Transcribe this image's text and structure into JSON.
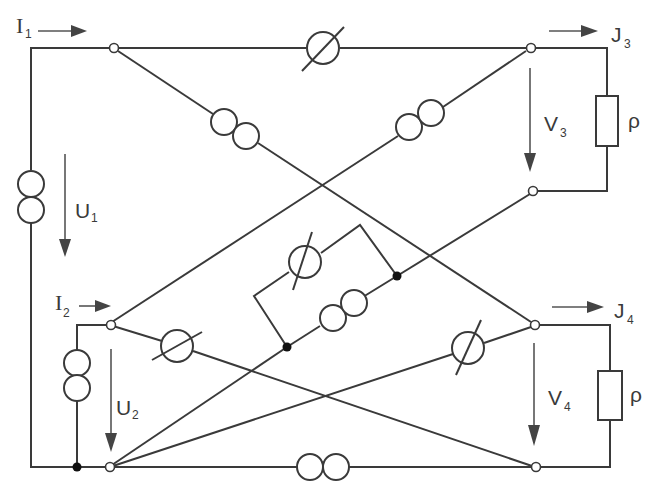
{
  "diagram": {
    "type": "circuit-schematic",
    "colors": {
      "line": "#3a3a3a",
      "background": "#ffffff",
      "label": "#3a3a3a"
    },
    "labels": {
      "I1": {
        "main": "I",
        "sub": "1"
      },
      "I2": {
        "main": "I",
        "sub": "2"
      },
      "U1": {
        "main": "U",
        "sub": "1"
      },
      "U2": {
        "main": "U",
        "sub": "2"
      },
      "J3": {
        "main": "J",
        "sub": "3"
      },
      "J4": {
        "main": "J",
        "sub": "4"
      },
      "V3": {
        "main": "V",
        "sub": "3"
      },
      "V4": {
        "main": "V",
        "sub": "4"
      },
      "rho_top": "ρ",
      "rho_bottom": "ρ"
    },
    "components": [
      {
        "id": "source-left-outer",
        "kind": "current-source (double circle)",
        "position": "left vertical branch"
      },
      {
        "id": "source-left-inner",
        "kind": "current-source (double circle)",
        "position": "port 2 vertical branch"
      },
      {
        "id": "source-diag-1",
        "kind": "current-source (double circle)",
        "position": "top-left to bottom-right diagonal"
      },
      {
        "id": "source-diag-2",
        "kind": "current-source (double circle)",
        "position": "bottom-left to top-right diagonal"
      },
      {
        "id": "source-center",
        "kind": "current-source (double circle)",
        "position": "center parallel branch"
      },
      {
        "id": "source-bottom",
        "kind": "current-source (double circle)",
        "position": "bottom horizontal wire"
      },
      {
        "id": "element-top",
        "kind": "circle with slash",
        "position": "top horizontal wire"
      },
      {
        "id": "element-center",
        "kind": "circle with slash",
        "position": "center parallel branch"
      },
      {
        "id": "element-lower-left",
        "kind": "circle with slash",
        "position": "port 2 top to port 4 bottom diagonal"
      },
      {
        "id": "element-lower-right",
        "kind": "circle with slash",
        "position": "port 2 bottom to port 4 top diagonal"
      },
      {
        "id": "load-top",
        "kind": "resistor",
        "label": "ρ"
      },
      {
        "id": "load-bottom",
        "kind": "resistor",
        "label": "ρ"
      }
    ]
  }
}
